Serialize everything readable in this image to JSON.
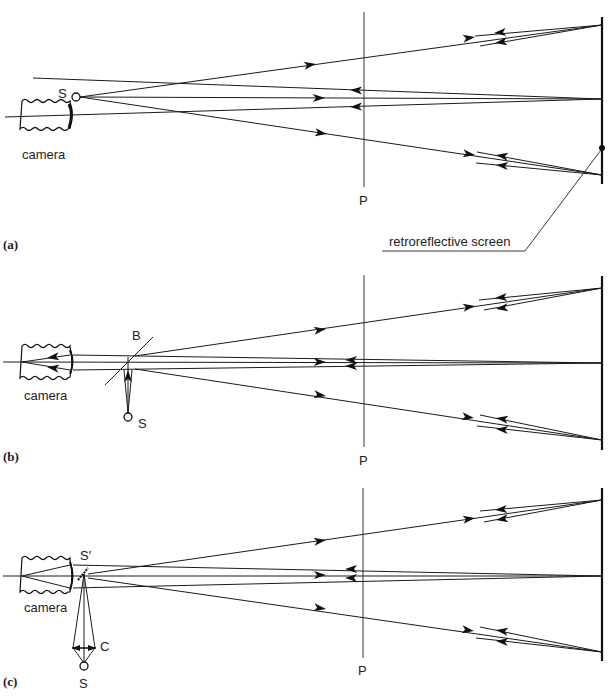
{
  "figure": {
    "panels": [
      {
        "id": "a",
        "label": "(a)",
        "camera_label": "camera",
        "source_label": "S",
        "plane_label": "P",
        "screen_label": "retroreflective screen"
      },
      {
        "id": "b",
        "label": "(b)",
        "camera_label": "camera",
        "source_label": "S",
        "beamsplitter_label": "B",
        "plane_label": "P"
      },
      {
        "id": "c",
        "label": "(c)",
        "camera_label": "camera",
        "source_label": "S",
        "image_source_label": "S′",
        "condenser_label": "C",
        "plane_label": "P"
      }
    ]
  }
}
